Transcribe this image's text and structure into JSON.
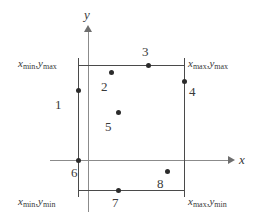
{
  "figure": {
    "type": "clipping-region-diagram",
    "axes": {
      "x_label": "x",
      "y_label": "y",
      "x_axis_y_px": 160,
      "y_axis_x_px": 88,
      "axis_color": "#8b8b8b"
    },
    "rectangle": {
      "left_px": 78,
      "right_px": 184,
      "top_px": 65,
      "bottom_px": 190,
      "edge_color": "#4a4a4a"
    },
    "corner_labels": [
      {
        "name": "top-left",
        "x_var": "x",
        "x_sub": "min",
        "y_var": "y",
        "y_sub": "max",
        "separator": ","
      },
      {
        "name": "top-right",
        "x_var": "x",
        "x_sub": "max",
        "y_var": "y",
        "y_sub": "max",
        "separator": ","
      },
      {
        "name": "bottom-left",
        "x_var": "x",
        "x_sub": "min",
        "y_var": "y",
        "y_sub": "min",
        "separator": ","
      },
      {
        "name": "bottom-right",
        "x_var": "x",
        "x_sub": "max",
        "y_var": "y",
        "y_sub": "min",
        "separator": ","
      }
    ],
    "points": [
      {
        "label": "1",
        "dot_x": 76,
        "dot_y": 88,
        "label_x": 55,
        "label_y": 98,
        "position": "on-left-edge"
      },
      {
        "label": "2",
        "dot_x": 109,
        "dot_y": 70,
        "label_x": 101,
        "label_y": 80,
        "position": "inside-upper"
      },
      {
        "label": "3",
        "dot_x": 146,
        "dot_y": 63,
        "label_x": 142,
        "label_y": 45,
        "position": "on-top-edge"
      },
      {
        "label": "4",
        "dot_x": 182,
        "dot_y": 79,
        "label_x": 189,
        "label_y": 85,
        "position": "on-right-edge"
      },
      {
        "label": "5",
        "dot_x": 116,
        "dot_y": 110,
        "label_x": 105,
        "label_y": 120,
        "position": "inside-center"
      },
      {
        "label": "6",
        "dot_x": 76,
        "dot_y": 158,
        "label_x": 71,
        "label_y": 166,
        "position": "on-left-edge-at-x-axis"
      },
      {
        "label": "7",
        "dot_x": 116,
        "dot_y": 188,
        "label_x": 112,
        "label_y": 196,
        "position": "on-bottom-edge"
      },
      {
        "label": "8",
        "dot_x": 165,
        "dot_y": 169,
        "label_x": 157,
        "label_y": 177,
        "position": "inside-lower"
      }
    ]
  }
}
